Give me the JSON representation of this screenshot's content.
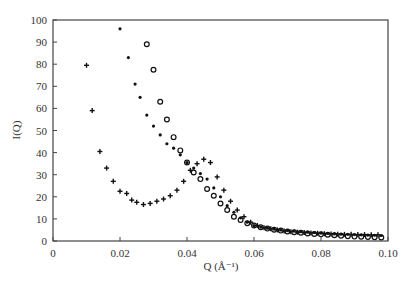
{
  "chart_data": {
    "type": "scatter",
    "title": "",
    "xlabel": "Q (Å⁻¹)",
    "ylabel": "I(Q)",
    "xlim": [
      0,
      0.1
    ],
    "ylim": [
      0,
      100
    ],
    "xticks": [
      "0",
      "0.02",
      "0.04",
      "0.06",
      "0.08",
      "0.10"
    ],
    "yticks": [
      "0",
      "10",
      "20",
      "30",
      "40",
      "50",
      "60",
      "70",
      "80",
      "90",
      "100"
    ],
    "grid": false,
    "legend": null,
    "series": [
      {
        "name": "plus",
        "marker": "+",
        "x": [
          0.01,
          0.0117,
          0.014,
          0.016,
          0.018,
          0.02,
          0.022,
          0.0235,
          0.025,
          0.027,
          0.029,
          0.031,
          0.033,
          0.035,
          0.037,
          0.039,
          0.041,
          0.043,
          0.045,
          0.047,
          0.049,
          0.051,
          0.053,
          0.055,
          0.057,
          0.059,
          0.061,
          0.063,
          0.065,
          0.067,
          0.069,
          0.071,
          0.073,
          0.075,
          0.077,
          0.079,
          0.081,
          0.083,
          0.085,
          0.087,
          0.089,
          0.091,
          0.093,
          0.095,
          0.097
        ],
        "y": [
          79.5,
          59,
          40.5,
          33,
          27,
          22.5,
          21.5,
          18.5,
          17.5,
          16.5,
          17,
          18,
          19,
          20.5,
          23,
          27,
          32,
          35,
          37,
          35.5,
          29,
          23,
          18,
          14,
          11,
          8.5,
          7,
          6,
          5.5,
          5,
          4.5,
          4.2,
          4,
          3.8,
          3.6,
          3.5,
          3.3,
          3.2,
          3.1,
          3,
          3,
          2.9,
          2.9,
          2.8,
          2.8
        ]
      },
      {
        "name": "dot",
        "marker": "•",
        "x": [
          0.02,
          0.0225,
          0.0245,
          0.026,
          0.028,
          0.03,
          0.032,
          0.034,
          0.036,
          0.038,
          0.04,
          0.042,
          0.044,
          0.046,
          0.048,
          0.05,
          0.052,
          0.054,
          0.056,
          0.058,
          0.06,
          0.062,
          0.064,
          0.066,
          0.068,
          0.07,
          0.072,
          0.074,
          0.076,
          0.078,
          0.08,
          0.082,
          0.084,
          0.086,
          0.088,
          0.09,
          0.092,
          0.094,
          0.096,
          0.098
        ],
        "y": [
          96,
          83,
          71,
          65,
          57,
          52,
          48,
          44,
          42,
          39,
          35.5,
          33,
          30.5,
          28,
          24,
          20,
          16,
          13,
          10.5,
          8.5,
          7,
          6.3,
          5.8,
          5.4,
          5,
          4.7,
          4.5,
          4.2,
          4,
          3.8,
          3.6,
          3.4,
          3.2,
          3.1,
          3,
          2.9,
          2.8,
          2.7,
          2.6,
          2.5
        ]
      },
      {
        "name": "circle",
        "marker": "o",
        "x": [
          0.028,
          0.03,
          0.032,
          0.034,
          0.036,
          0.038,
          0.04,
          0.042,
          0.044,
          0.046,
          0.048,
          0.05,
          0.052,
          0.054,
          0.056,
          0.058,
          0.06,
          0.062,
          0.064,
          0.066,
          0.068,
          0.07,
          0.072,
          0.074,
          0.076,
          0.078,
          0.08,
          0.082,
          0.084,
          0.086,
          0.088,
          0.09,
          0.092,
          0.094,
          0.096,
          0.098
        ],
        "y": [
          89,
          77.5,
          63,
          55,
          47,
          41,
          35.5,
          31,
          28,
          23.5,
          20.5,
          17,
          14,
          11,
          9.5,
          8,
          7,
          6.2,
          5.6,
          5.1,
          4.7,
          4.3,
          4,
          3.7,
          3.4,
          3.2,
          3,
          2.8,
          2.6,
          2.4,
          2.2,
          2,
          1.9,
          1.8,
          1.7,
          1.6
        ]
      }
    ]
  }
}
